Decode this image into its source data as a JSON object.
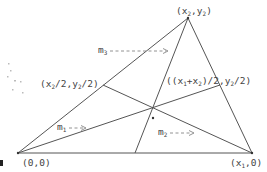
{
  "diagram": {
    "type": "triangle-medians",
    "vertices": [
      {
        "id": "A",
        "label": "(0,0)",
        "px": [
          18,
          153
        ]
      },
      {
        "id": "B",
        "label": "(x1,0)",
        "px": [
          252,
          153
        ]
      },
      {
        "id": "C",
        "label": "(x2,y2)",
        "px": [
          188,
          18
        ]
      }
    ],
    "midpoints": [
      {
        "id": "M_AC",
        "label": "(x2/2,y2/2)",
        "px": [
          103,
          85
        ]
      },
      {
        "id": "M_BC",
        "label": "((x1+x2)/2,y2/2)",
        "px": [
          220,
          85
        ]
      },
      {
        "id": "M_AB",
        "label": "",
        "px": [
          135,
          153
        ]
      }
    ],
    "centroid_px": [
      153,
      118
    ],
    "median_labels": [
      {
        "name": "m1",
        "text": "m",
        "sub": "1",
        "arrow": "-- ->"
      },
      {
        "name": "m2",
        "text": "m",
        "sub": "2",
        "arrow": "-- -->"
      },
      {
        "name": "m3",
        "text": "m",
        "sub": "3",
        "arrow": "-- -- -- -->"
      }
    ]
  },
  "labels": {
    "origin": {
      "open": "(0,0)"
    },
    "x1_vertex": {
      "pre": "(x",
      "sub": "1",
      "post": ",0)"
    },
    "apex": {
      "pre": "(x",
      "sub1": "2",
      "mid": ",y",
      "sub2": "2",
      "post": ")"
    },
    "left_mid": {
      "pre": "(x",
      "sub1": "2",
      "mid": "/2,y",
      "sub2": "2",
      "post": "/2)"
    },
    "right_mid": {
      "pre": "((x",
      "sub1": "1",
      "mid1": "+x",
      "sub2": "2",
      "mid2": ")/2,y",
      "sub3": "2",
      "post": "/2)"
    },
    "m1": {
      "m": "m",
      "sub": "1",
      "arrow": "-- ->"
    },
    "m2": {
      "m": "m",
      "sub": "2",
      "arrow": "-- -->"
    },
    "m3": {
      "m": "m",
      "sub": "3",
      "arrow": "-- -- -- -->"
    }
  }
}
